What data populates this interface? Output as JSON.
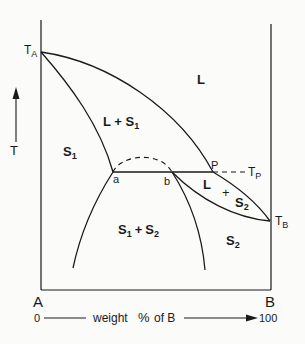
{
  "diagram": {
    "type": "binary phase diagram (peritectic)",
    "y_axis_label": "T",
    "component_left": "A",
    "component_right": "B",
    "x_axis": {
      "start": "0",
      "label_prefix": "weight",
      "percent_symbol": "%",
      "label_suffix": "of B",
      "end": "100"
    },
    "temperature_labels": {
      "ta": "T",
      "ta_sub": "A",
      "tb": "T",
      "tb_sub": "B",
      "tp": "T",
      "tp_sub": "P"
    },
    "points": {
      "a": "a",
      "b": "b",
      "p": "P"
    },
    "regions": {
      "liquid": "L",
      "liquid_s1": {
        "main": "L + S",
        "sub": "1"
      },
      "s1": {
        "main": "S",
        "sub": "1"
      },
      "s1_s2": {
        "a": "S",
        "a_sub": "1",
        "plus": "+",
        "b": "S",
        "b_sub": "2"
      },
      "liquid_s2": {
        "l": "L",
        "plus": "+",
        "s": "S",
        "s_sub": "2"
      },
      "s2": {
        "main": "S",
        "sub": "2"
      }
    },
    "line_color": "#1a1a1a",
    "background": "#fbfbfa"
  }
}
